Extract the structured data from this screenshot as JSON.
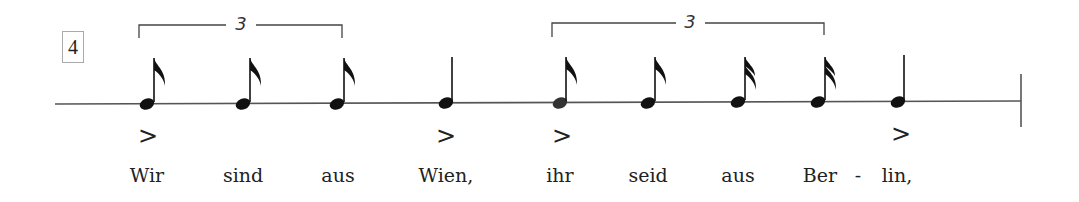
{
  "measure_number": "4",
  "tuplets": [
    {
      "number": "3",
      "x_start": 139,
      "x_end": 342,
      "label_x": 240
    },
    {
      "number": "3",
      "x_start": 552,
      "x_end": 824,
      "label_x": 690
    }
  ],
  "notes": [
    {
      "x": 147,
      "type": "eighth",
      "accent": true,
      "lyric": "Wir"
    },
    {
      "x": 243,
      "type": "eighth",
      "accent": false,
      "lyric": "sind"
    },
    {
      "x": 337,
      "type": "eighth",
      "accent": false,
      "lyric": "aus"
    },
    {
      "x": 446,
      "type": "quarter",
      "accent": true,
      "lyric": "Wien,"
    },
    {
      "x": 560,
      "type": "eighth",
      "accent": true,
      "lyric": "ihr"
    },
    {
      "x": 648,
      "type": "eighth",
      "accent": false,
      "lyric": "seid"
    },
    {
      "x": 738,
      "type": "sixteenth",
      "accent": false,
      "lyric": "aus"
    },
    {
      "x": 818,
      "type": "sixteenth",
      "accent": false,
      "lyric": "Ber"
    },
    {
      "x": 898,
      "type": "quarter",
      "accent": true,
      "lyric": "lin,"
    }
  ],
  "hyphen": {
    "text": "-",
    "x": 858
  },
  "accent_symbol": ">",
  "lyrics": {
    "l0": "Wir",
    "l1": "sind",
    "l2": "aus",
    "l3": "Wien,",
    "l4": "ihr",
    "l5": "seid",
    "l6": "aus",
    "l7": "Ber",
    "l8": "lin,",
    "hyphen": "-"
  },
  "colors": {
    "ink": "#222222",
    "staff": "#555555",
    "background": "#ffffff"
  }
}
